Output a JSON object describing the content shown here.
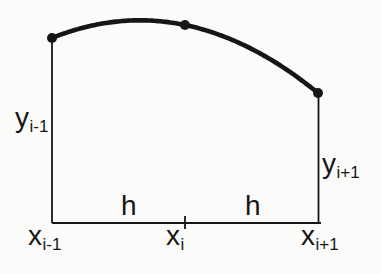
{
  "figure": {
    "background": "#fbfbfa",
    "ink_color": "#161616"
  },
  "labels": {
    "y_left": {
      "base": "y",
      "sub": "i-1"
    },
    "y_right": {
      "base": "y",
      "sub": "i+1"
    },
    "x_left": {
      "base": "x",
      "sub": "i-1"
    },
    "x_mid": {
      "base": "x",
      "sub": "i"
    },
    "x_right": {
      "base": "x",
      "sub": "i+1"
    },
    "h_left": "h",
    "h_right": "h"
  },
  "geometry": {
    "points": [
      {
        "x": 52,
        "y": 38
      },
      {
        "x": 185,
        "y": 25
      },
      {
        "x": 318,
        "y": 93
      }
    ],
    "baseline": {
      "x1": 52,
      "x2": 321,
      "y": 223
    },
    "tick": {
      "x": 185,
      "y1": 216,
      "y2": 229
    },
    "left_drop": {
      "x": 52,
      "y1": 38,
      "y2": 223
    },
    "right_drop": {
      "x": 318.5,
      "y1": 93,
      "y2": 223
    },
    "dot_radius": 5,
    "curve_width": 4.6,
    "line_width": 1.8
  }
}
